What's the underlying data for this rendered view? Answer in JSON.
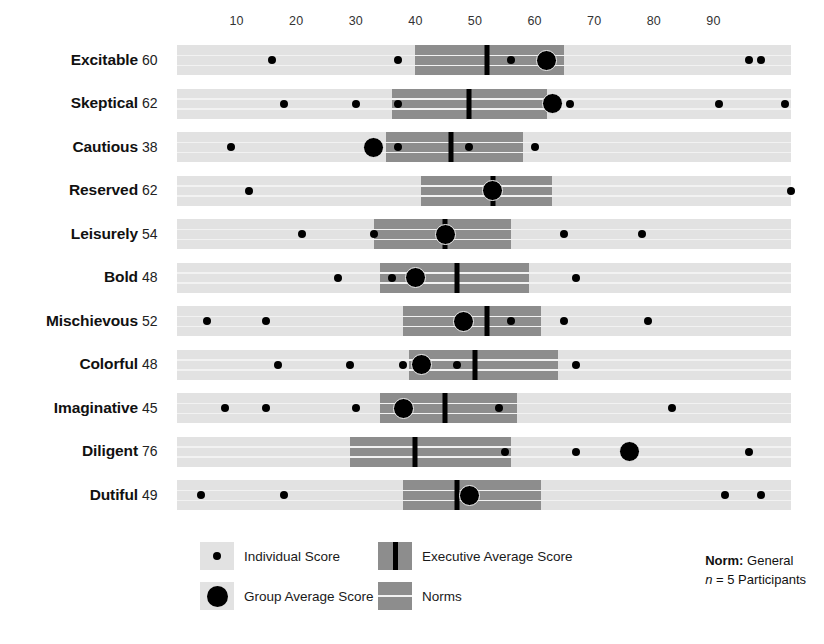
{
  "chart_data": {
    "type": "bar",
    "title": "",
    "subtitle": "",
    "xlabel": "",
    "ylabel": "",
    "xlim": [
      0,
      103
    ],
    "x_ticks": [
      10,
      20,
      30,
      40,
      50,
      60,
      70,
      80,
      90
    ],
    "grid": false,
    "legend_position": "bottom",
    "categories": [
      "Excitable",
      "Skeptical",
      "Cautious",
      "Reserved",
      "Leisurely",
      "Bold",
      "Mischievous",
      "Colorful",
      "Imaginative",
      "Diligent",
      "Dutiful"
    ],
    "scores": [
      60,
      62,
      38,
      62,
      54,
      48,
      52,
      48,
      45,
      76,
      49
    ],
    "series": [
      {
        "name": "Norms",
        "type": "range-band",
        "values": [
          [
            40,
            65
          ],
          [
            36,
            62
          ],
          [
            35,
            58
          ],
          [
            41,
            63
          ],
          [
            33,
            56
          ],
          [
            34,
            59
          ],
          [
            38,
            61
          ],
          [
            39,
            64
          ],
          [
            34,
            57
          ],
          [
            29,
            56
          ],
          [
            38,
            61
          ]
        ]
      },
      {
        "name": "Executive Average Score",
        "type": "marker-line",
        "values": [
          52,
          49,
          46,
          53,
          45,
          47,
          52,
          50,
          45,
          40,
          47
        ]
      },
      {
        "name": "Group Average Score",
        "type": "marker-large",
        "values": [
          62,
          63,
          33,
          53,
          45,
          40,
          48,
          41,
          38,
          76,
          49
        ]
      },
      {
        "name": "Individual Score",
        "type": "marker-small",
        "values": [
          [
            16,
            37,
            56,
            96,
            98
          ],
          [
            18,
            30,
            37,
            66,
            91,
            102
          ],
          [
            9,
            37,
            49,
            60
          ],
          [
            12,
            103
          ],
          [
            21,
            33,
            65,
            78
          ],
          [
            27,
            36,
            67
          ],
          [
            5,
            15,
            56,
            65,
            79
          ],
          [
            17,
            29,
            38,
            47,
            67
          ],
          [
            8,
            15,
            30,
            54,
            83
          ],
          [
            55,
            67,
            96
          ],
          [
            4,
            18,
            92,
            98
          ]
        ]
      }
    ],
    "legend": [
      {
        "key": "individual-score",
        "label": "Individual Score"
      },
      {
        "key": "group-average-score",
        "label": "Group Average Score"
      },
      {
        "key": "executive-average-score",
        "label": "Executive Average Score"
      },
      {
        "key": "norms",
        "label": "Norms"
      }
    ],
    "norm_note": {
      "label": "Norm:",
      "value": "General",
      "n_prefix": "n",
      "n_text": "= 5 Participants"
    },
    "colors": {
      "norm_background": "#e2e2e2",
      "norm_band": "#8d8d8d",
      "marker": "#000000",
      "band_line": "#f2f2f2",
      "text": "#1a1a1a"
    }
  }
}
